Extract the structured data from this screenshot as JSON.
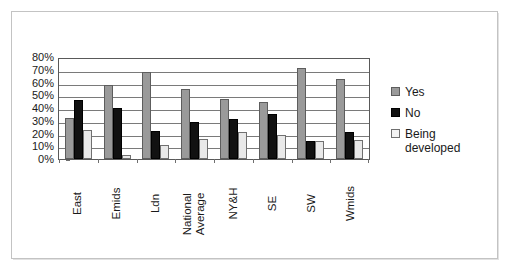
{
  "chart_data": {
    "type": "bar",
    "title": "",
    "xlabel": "",
    "ylabel": "",
    "ylim": [
      0,
      80
    ],
    "ytick_labels": [
      "80%",
      "70%",
      "60%",
      "50%",
      "40%",
      "30%",
      "20%",
      "10%",
      "0%"
    ],
    "ytick_values": [
      80,
      70,
      60,
      50,
      40,
      30,
      20,
      10,
      0
    ],
    "grid": true,
    "legend_position": "right",
    "categories": [
      "East",
      "Emids",
      "Ldn",
      "National Average",
      "NY&H",
      "SE",
      "SW",
      "Wmids"
    ],
    "series": [
      {
        "name": "Yes",
        "color": "#9a9a9a",
        "values": [
          32,
          58,
          68,
          55,
          47,
          45,
          71,
          63
        ]
      },
      {
        "name": "No",
        "color": "#111111",
        "values": [
          46,
          40,
          22,
          29,
          31,
          35,
          14,
          21
        ]
      },
      {
        "name": "Being developed",
        "color": "#e9e9e9",
        "values": [
          23,
          3,
          11,
          16,
          21,
          19,
          14,
          15
        ]
      }
    ]
  },
  "legend": {
    "items": [
      {
        "label": "Yes"
      },
      {
        "label": "No"
      },
      {
        "label": "Being developed"
      }
    ]
  },
  "colors": {
    "series_yes": "#9a9a9a",
    "series_no": "#111111",
    "series_being_developed": "#e9e9e9",
    "frame": "#c3c3c3",
    "axis": "#595959",
    "grid": "#7a7a7a",
    "text": "#1a1a1a",
    "background": "#ffffff"
  }
}
